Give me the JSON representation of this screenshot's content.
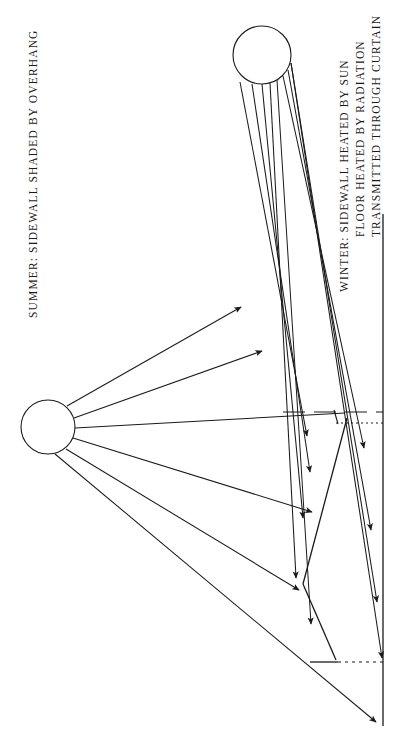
{
  "figure": {
    "type": "technical-line-diagram",
    "background_color": "#ffffff",
    "line_color": "#1a1a1a"
  },
  "labels": {
    "summer": "SUMMER: SIDEWALL SHADED BY OVERHANG",
    "winter_line1": "WINTER: SIDEWALL HEATED BY SUN",
    "winter_line2": "FLOOR HEATED BY RADIATION",
    "winter_line3": "TRANSMITTED THROUGH CURTAIN"
  },
  "elements": {
    "summer_sun": "summer-sun-circle",
    "winter_sun": "winter-sun-circle",
    "wall": "sidewall-line",
    "overhang": "roof-overhang-line",
    "curtain": "curtain-glazing-line",
    "floor": "floor-line",
    "sill_dashed": "sill-dashed-line",
    "head_dotted": "head-dotted-line",
    "floor_dotted": "floor-dotted-line",
    "summer_rays": "summer-ray-bundle",
    "winter_rays": "winter-ray-bundle"
  },
  "geometry": {
    "summer_sun": {
      "cx": 48,
      "cy": 427,
      "r": 27
    },
    "winter_sun": {
      "cx": 262,
      "cy": 55,
      "r": 29
    },
    "wall_x": 383,
    "wall_y_top": 214,
    "wall_y_bottom": 726,
    "overhang_apex": {
      "x": 303,
      "y": 584
    },
    "overhang_top": {
      "x": 347,
      "y": 418
    },
    "curtain_bottom": {
      "x": 336,
      "y": 660
    },
    "floor_y": 662,
    "sill_y": 413,
    "head_y": 423
  }
}
